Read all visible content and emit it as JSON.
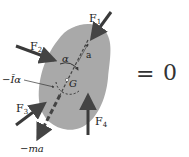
{
  "diagram": {
    "body_color": "#a9a9a9",
    "arrow_color": "#3a3a3a",
    "labels": {
      "f1": "F",
      "f1_sub": "1",
      "f2": "F",
      "f2_sub": "2",
      "f3": "F",
      "f3_sub": "3",
      "f4": "F",
      "f4_sub": "4",
      "alpha": "α",
      "a_bar": "a",
      "g": "G",
      "inertia_moment": "−Īα",
      "inertia_force": "−ma"
    },
    "equation": {
      "equals": "=",
      "rhs": "0"
    }
  }
}
